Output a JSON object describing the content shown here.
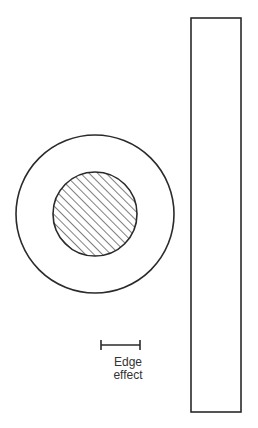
{
  "diagram": {
    "annotation": {
      "line1": "Edge",
      "line2": "effect"
    },
    "colors": {
      "stroke": "#2a2a2a",
      "background": "#ffffff"
    }
  }
}
